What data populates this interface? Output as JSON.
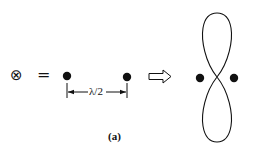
{
  "diagram": {
    "lhs_symbol": "⊗",
    "equals_sign": "=",
    "spacing_label": "λ/2",
    "implication_arrow": "hollow-right-arrow",
    "result": "figure-eight radiation pattern between two dipole sources",
    "caption": "(a)"
  },
  "colors": {
    "ink": "#111111",
    "background": "#ffffff"
  }
}
